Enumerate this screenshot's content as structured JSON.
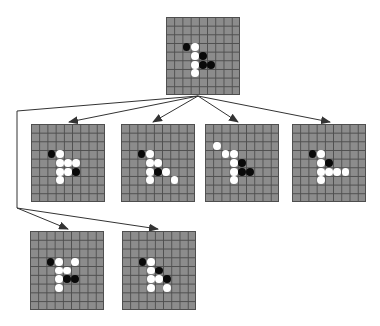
{
  "diagram": {
    "type": "game-tree",
    "grid_size": 9,
    "colors": {
      "board": "#8c8c8c",
      "grid_line": "#4e4e4e",
      "black_stone": "#0a0a0a",
      "white_stone": "#ffffff",
      "edge": "#333333"
    },
    "nodes": [
      {
        "id": "root",
        "x": 166,
        "y": 17,
        "w": 74,
        "h": 78,
        "stones": [
          {
            "c": 2,
            "r": 3,
            "color": "black"
          },
          {
            "c": 3,
            "r": 3,
            "color": "white"
          },
          {
            "c": 3,
            "r": 4,
            "color": "white"
          },
          {
            "c": 4,
            "r": 4,
            "color": "black"
          },
          {
            "c": 3,
            "r": 5,
            "color": "white"
          },
          {
            "c": 4,
            "r": 5,
            "color": "black"
          },
          {
            "c": 5,
            "r": 5,
            "color": "black"
          },
          {
            "c": 3,
            "r": 6,
            "color": "white"
          }
        ]
      },
      {
        "id": "child-1",
        "x": 31,
        "y": 124,
        "w": 74,
        "h": 78,
        "stones": [
          {
            "c": 2,
            "r": 3,
            "color": "black"
          },
          {
            "c": 3,
            "r": 3,
            "color": "white"
          },
          {
            "c": 3,
            "r": 4,
            "color": "white"
          },
          {
            "c": 4,
            "r": 4,
            "color": "white"
          },
          {
            "c": 5,
            "r": 4,
            "color": "white"
          },
          {
            "c": 3,
            "r": 5,
            "color": "white"
          },
          {
            "c": 4,
            "r": 5,
            "color": "white"
          },
          {
            "c": 5,
            "r": 5,
            "color": "black"
          },
          {
            "c": 3,
            "r": 6,
            "color": "white"
          }
        ]
      },
      {
        "id": "child-2",
        "x": 121,
        "y": 124,
        "w": 74,
        "h": 78,
        "stones": [
          {
            "c": 2,
            "r": 3,
            "color": "black"
          },
          {
            "c": 3,
            "r": 3,
            "color": "white"
          },
          {
            "c": 3,
            "r": 4,
            "color": "white"
          },
          {
            "c": 4,
            "r": 4,
            "color": "white"
          },
          {
            "c": 3,
            "r": 5,
            "color": "white"
          },
          {
            "c": 4,
            "r": 5,
            "color": "black"
          },
          {
            "c": 5,
            "r": 5,
            "color": "white"
          },
          {
            "c": 3,
            "r": 6,
            "color": "white"
          },
          {
            "c": 6,
            "r": 6,
            "color": "white"
          }
        ]
      },
      {
        "id": "child-3",
        "x": 205,
        "y": 124,
        "w": 74,
        "h": 78,
        "stones": [
          {
            "c": 1,
            "r": 2,
            "color": "white"
          },
          {
            "c": 2,
            "r": 3,
            "color": "white"
          },
          {
            "c": 3,
            "r": 3,
            "color": "white"
          },
          {
            "c": 3,
            "r": 4,
            "color": "white"
          },
          {
            "c": 4,
            "r": 4,
            "color": "black"
          },
          {
            "c": 3,
            "r": 5,
            "color": "white"
          },
          {
            "c": 4,
            "r": 5,
            "color": "black"
          },
          {
            "c": 5,
            "r": 5,
            "color": "black"
          },
          {
            "c": 3,
            "r": 6,
            "color": "white"
          }
        ]
      },
      {
        "id": "child-4",
        "x": 292,
        "y": 124,
        "w": 74,
        "h": 78,
        "stones": [
          {
            "c": 2,
            "r": 3,
            "color": "black"
          },
          {
            "c": 3,
            "r": 3,
            "color": "white"
          },
          {
            "c": 3,
            "r": 4,
            "color": "white"
          },
          {
            "c": 4,
            "r": 4,
            "color": "black"
          },
          {
            "c": 3,
            "r": 5,
            "color": "white"
          },
          {
            "c": 4,
            "r": 5,
            "color": "white"
          },
          {
            "c": 5,
            "r": 5,
            "color": "white"
          },
          {
            "c": 6,
            "r": 5,
            "color": "white"
          },
          {
            "c": 3,
            "r": 6,
            "color": "white"
          }
        ]
      },
      {
        "id": "child-5",
        "x": 30,
        "y": 231,
        "w": 74,
        "h": 79,
        "stones": [
          {
            "c": 2,
            "r": 3,
            "color": "black"
          },
          {
            "c": 3,
            "r": 3,
            "color": "white"
          },
          {
            "c": 5,
            "r": 3,
            "color": "white"
          },
          {
            "c": 3,
            "r": 4,
            "color": "white"
          },
          {
            "c": 4,
            "r": 4,
            "color": "white"
          },
          {
            "c": 3,
            "r": 5,
            "color": "white"
          },
          {
            "c": 4,
            "r": 5,
            "color": "black"
          },
          {
            "c": 5,
            "r": 5,
            "color": "black"
          },
          {
            "c": 3,
            "r": 6,
            "color": "white"
          }
        ]
      },
      {
        "id": "child-6",
        "x": 122,
        "y": 231,
        "w": 74,
        "h": 79,
        "stones": [
          {
            "c": 2,
            "r": 3,
            "color": "black"
          },
          {
            "c": 3,
            "r": 3,
            "color": "white"
          },
          {
            "c": 3,
            "r": 4,
            "color": "white"
          },
          {
            "c": 4,
            "r": 4,
            "color": "black"
          },
          {
            "c": 3,
            "r": 5,
            "color": "white"
          },
          {
            "c": 4,
            "r": 5,
            "color": "white"
          },
          {
            "c": 5,
            "r": 5,
            "color": "black"
          },
          {
            "c": 3,
            "r": 6,
            "color": "white"
          },
          {
            "c": 5,
            "r": 6,
            "color": "white"
          }
        ]
      }
    ],
    "edges": [
      {
        "from": "root",
        "to": "child-1",
        "points": [
          [
            198,
            96
          ],
          [
            69,
            122
          ]
        ],
        "arrow": true
      },
      {
        "from": "root",
        "to": "child-2",
        "points": [
          [
            198,
            96
          ],
          [
            153,
            122
          ]
        ],
        "arrow": true
      },
      {
        "from": "root",
        "to": "child-3",
        "points": [
          [
            198,
            96
          ],
          [
            238,
            122
          ]
        ],
        "arrow": true
      },
      {
        "from": "root",
        "to": "child-4",
        "points": [
          [
            198,
            96
          ],
          [
            330,
            122
          ]
        ],
        "arrow": true
      },
      {
        "from": "root",
        "to": "junction",
        "points": [
          [
            198,
            96
          ],
          [
            17,
            111
          ],
          [
            17,
            208
          ]
        ],
        "arrow": false
      },
      {
        "from": "junction",
        "to": "child-5",
        "points": [
          [
            17,
            208
          ],
          [
            68,
            229
          ]
        ],
        "arrow": true
      },
      {
        "from": "junction",
        "to": "child-6",
        "points": [
          [
            17,
            208
          ],
          [
            158,
            229
          ]
        ],
        "arrow": true
      }
    ]
  }
}
